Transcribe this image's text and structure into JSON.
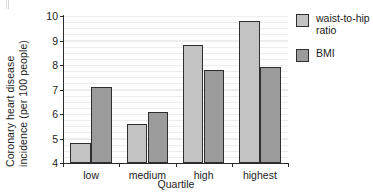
{
  "chart_data": {
    "type": "bar",
    "title": "",
    "subtitle": "",
    "xlabel": "Quartile",
    "ylabel": "Coronary heart disease incidence (per 100 people)",
    "ylabel_line1": "Coronary heart disease",
    "ylabel_line2": "incidence (per 100 people)",
    "categories": [
      "low",
      "medium",
      "high",
      "highest"
    ],
    "series": [
      {
        "name": "waist-to-hip ratio",
        "name_line1": "waist-to-hip",
        "name_line2": "ratio",
        "color": "#c3c3c3",
        "values": [
          4.8,
          5.6,
          8.8,
          9.8
        ]
      },
      {
        "name": "BMI",
        "name_line1": "BMI",
        "name_line2": "",
        "color": "#9b9b9b",
        "values": [
          7.1,
          6.1,
          7.8,
          7.9
        ]
      }
    ],
    "ylim": [
      4,
      10
    ],
    "yticks": [
      4,
      5,
      6,
      7,
      8,
      9,
      10
    ],
    "ytick_labels": [
      "4",
      "5",
      "6",
      "7",
      "8",
      "9",
      "10"
    ],
    "grid": true,
    "grid_orientation": "horizontal",
    "grid_color": "#ededed",
    "legend_position": "right",
    "axis_color": "#2b2b2b",
    "bar_edge_color": "#2e2e2e",
    "background": "#ffffff"
  }
}
